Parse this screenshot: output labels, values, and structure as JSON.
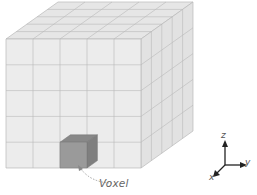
{
  "figure": {
    "grid": {
      "nx": 5,
      "ny": 5,
      "nz": 5
    },
    "front_face": {
      "x0": 6,
      "y0": 39,
      "x1": 141,
      "y1": 168
    },
    "depth_offset": {
      "dx": 52,
      "dy": -37
    },
    "colors": {
      "face_front": "#ececec",
      "face_top": "#e6e6e6",
      "face_side": "#e2e2e2",
      "grid_line": "#b9b9b9",
      "voxel_front": "#9a9a9a",
      "voxel_top": "#888888",
      "voxel_side": "#7f7f7f",
      "arrow": "#222222"
    },
    "highlighted_voxel": {
      "column": 2,
      "row_from_bottom": 0
    },
    "voxel_label": "Voxel",
    "axes": {
      "z": "z",
      "y": "y",
      "x": "x"
    }
  }
}
